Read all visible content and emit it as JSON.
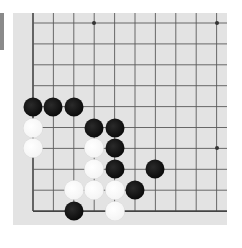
{
  "board": {
    "size_visible": {
      "cols": 10,
      "rows": 10
    },
    "corner": "bottom-left",
    "colors": {
      "background": "#e3e3e3",
      "line": "#5a5a5a",
      "edge_line": "#444444",
      "black": "#111111",
      "white": "#ffffff"
    },
    "star_points": [
      [
        3,
        0
      ],
      [
        9,
        0
      ],
      [
        9,
        6
      ],
      [
        3,
        6
      ]
    ],
    "stones": {
      "black": [
        [
          0,
          4
        ],
        [
          1,
          4
        ],
        [
          2,
          4
        ],
        [
          3,
          5
        ],
        [
          4,
          5
        ],
        [
          4,
          6
        ],
        [
          4,
          7
        ],
        [
          6,
          7
        ],
        [
          5,
          8
        ],
        [
          2,
          9
        ]
      ],
      "white": [
        [
          0,
          5
        ],
        [
          0,
          6
        ],
        [
          3,
          6
        ],
        [
          3,
          7
        ],
        [
          2,
          8
        ],
        [
          3,
          8
        ],
        [
          4,
          8
        ],
        [
          4,
          9
        ]
      ]
    }
  },
  "side_tab": {
    "color": "#8a8a8a"
  }
}
